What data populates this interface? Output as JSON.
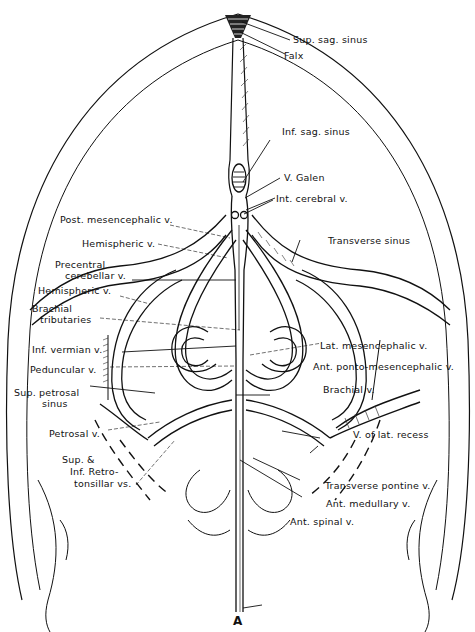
{
  "figure": {
    "panel_label": "A",
    "labels": {
      "sup_sag_sinus": "Sup. sag. sinus",
      "falx": "Falx",
      "inf_sag_sinus": "Inf. sag. sinus",
      "v_galen": "V. Galen",
      "int_cerebral_v": "Int. cerebral v.",
      "post_mesencephalic_v": "Post. mesencephalic v.",
      "transverse_sinus": "Transverse sinus",
      "hemispheric_v_upper": "Hemispheric v.",
      "precentral_cerebellar_v_1": "Precentral",
      "precentral_cerebellar_v_2": "cerebellar v.",
      "hemispheric_v_lower": "Hemispheric v.",
      "brachial_tributaries_1": "Brachial",
      "brachial_tributaries_2": "tributaries",
      "inf_vermian_v": "Inf. vermian v.",
      "lat_mesencephalic_v": "Lat. mesencephalic v.",
      "peduncular_v": "Peduncular v.",
      "ant_ponto_mesencephalic_v": "Ant. ponto-mesencephalic v.",
      "sup_petrosal_sinus_1": "Sup. petrosal",
      "sup_petrosal_sinus_2": "sinus",
      "brachial_v": "Brachial v.",
      "petrosal_v": "Petrosal v.",
      "v_of_lat_recess": "V. of lat. recess",
      "retrotonsillar_1": "Sup. &",
      "retrotonsillar_2": "Inf. Retro-",
      "retrotonsillar_3": "tonsillar vs.",
      "transverse_pontine_v": "Transverse pontine v.",
      "ant_medullary_v": "Ant. medullary v.",
      "ant_spinal_v": "Ant. spinal v."
    }
  }
}
